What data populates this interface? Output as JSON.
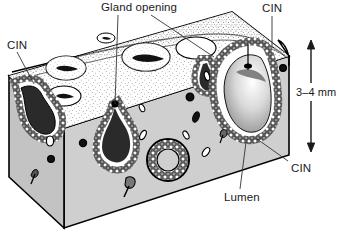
{
  "figure": {
    "view": "three-dimensional cut block, isometric"
  },
  "labels": {
    "gland_opening": "Gland opening",
    "cin_left": "CIN",
    "cin_top_right": "CIN",
    "cin_bottom_right": "CIN",
    "lumen": "Lumen",
    "depth_scale": "3–4 mm"
  },
  "colors": {
    "ink": "#000000",
    "label_text": "#1a1a1a",
    "stroma_front": "#cfcfcf",
    "stroma_left": "#c4c4c4",
    "stroma_right": "#bdbdbd",
    "surface_top": "#ffffff",
    "epithelium_fill": "#ffffff",
    "epithelium_outline": "#000000",
    "lumen_content": "#9a9a9a",
    "background": "#ffffff"
  },
  "annotations": {
    "scale_arrow": {
      "orientation": "vertical",
      "double_headed": true,
      "value": "3–4 mm",
      "top_y": 44,
      "bottom_y": 148
    },
    "leader_lines": [
      {
        "label": "Gland opening",
        "from": [
          118,
          14
        ],
        "to": [
          115,
          106
        ]
      },
      {
        "label": "Gland opening",
        "from": [
          150,
          14
        ],
        "to": [
          213,
          57
        ]
      },
      {
        "label": "CIN",
        "from": [
          17,
          51
        ],
        "to": [
          35,
          83
        ]
      },
      {
        "label": "CIN",
        "from": [
          272,
          15
        ],
        "to": [
          272,
          48
        ]
      },
      {
        "label": "CIN",
        "from": [
          289,
          161
        ],
        "to": [
          258,
          140
        ]
      },
      {
        "label": "Lumen",
        "from": [
          241,
          189
        ],
        "to": [
          246,
          143
        ]
      }
    ]
  },
  "structures": {
    "top_surface": "stippled squamous surface epithelium with ring-shaped gland openings",
    "front_face": "cut stromal face, pale gray, with small vessels and inflammatory cells",
    "glands": "crypts lined by cobblestone (CIN-involved) epithelium extending into stroma",
    "gland_count_visible": 4,
    "openings_visible": 4,
    "depth_of_crypts": "3–4 mm"
  }
}
